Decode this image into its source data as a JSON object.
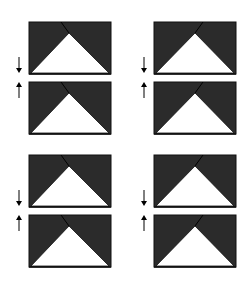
{
  "diagram": {
    "colors": {
      "dark": "#2b2b2b",
      "light": "#ffffff",
      "line": "#111111"
    },
    "groups": [
      {
        "id": "top-left",
        "rect_x": 29,
        "rect_w": 82,
        "top_y": 22,
        "bottom_y": 82,
        "h": 52,
        "crease_top_x": 61,
        "apex_x": 69,
        "arrow_x": 19
      },
      {
        "id": "top-right",
        "rect_x": 154,
        "rect_w": 82,
        "top_y": 22,
        "bottom_y": 82,
        "h": 52,
        "crease_top_x": 203,
        "apex_x": 195,
        "arrow_x": 144
      },
      {
        "id": "bottom-left",
        "rect_x": 29,
        "rect_w": 82,
        "top_y": 155,
        "bottom_y": 215,
        "h": 52,
        "crease_top_x": 61,
        "apex_x": 69,
        "arrow_x": 19
      },
      {
        "id": "bottom-right",
        "rect_x": 154,
        "rect_w": 82,
        "top_y": 155,
        "bottom_y": 215,
        "h": 52,
        "crease_top_x": 203,
        "apex_x": 195,
        "arrow_x": 144
      }
    ],
    "arrows": {
      "down": "↓",
      "up": "↑"
    }
  }
}
